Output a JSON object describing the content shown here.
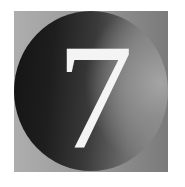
{
  "badge": {
    "numeral": "7",
    "colors": {
      "tile_light": "#aeaeae",
      "tile_dark": "#7a7a7a",
      "disc_dark": "#141414",
      "disc_light": "#a4a4a4",
      "numeral": "#f4f4f4"
    }
  }
}
